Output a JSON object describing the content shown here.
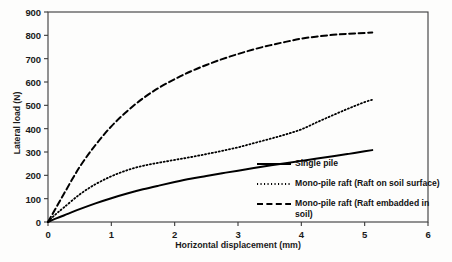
{
  "chart_data": {
    "type": "line",
    "title": "",
    "xlabel": "Horizontal displacement (mm)",
    "ylabel": "Lateral load (N)",
    "xlim": [
      0,
      6
    ],
    "ylim": [
      0,
      900
    ],
    "xticks": [
      0,
      1,
      2,
      3,
      4,
      5,
      6
    ],
    "yticks": [
      0,
      100,
      200,
      300,
      400,
      500,
      600,
      700,
      800,
      900
    ],
    "xtick_labels": [
      "0",
      "1",
      "2",
      "3",
      "4",
      "5",
      "6"
    ],
    "ytick_labels": [
      "0",
      "100",
      "200",
      "300",
      "400",
      "500",
      "600",
      "700",
      "800",
      "900"
    ],
    "grid": false,
    "legend_position": "inside-lower-right",
    "series": [
      {
        "name": "Single pile",
        "style": "solid",
        "color": "#000000",
        "x": [
          0,
          0.1,
          0.25,
          0.5,
          0.75,
          1.0,
          1.25,
          1.5,
          1.75,
          2.0,
          2.25,
          2.5,
          2.75,
          3.0,
          3.25,
          3.5,
          3.75,
          4.0,
          4.25,
          4.5,
          4.75,
          5.0,
          5.12
        ],
        "y": [
          0,
          12,
          28,
          55,
          80,
          102,
          122,
          140,
          156,
          171,
          185,
          197,
          209,
          220,
          231,
          242,
          252,
          262,
          272,
          282,
          292,
          303,
          308
        ]
      },
      {
        "name": "Mono-pile raft (Raft on soil surface)",
        "style": "dotted",
        "color": "#000000",
        "x": [
          0,
          0.1,
          0.25,
          0.5,
          0.75,
          1.0,
          1.25,
          1.5,
          1.75,
          2.0,
          2.25,
          2.5,
          2.75,
          3.0,
          3.25,
          3.5,
          3.75,
          4.0,
          4.25,
          4.5,
          4.75,
          5.0,
          5.12
        ],
        "y": [
          0,
          28,
          62,
          118,
          162,
          196,
          222,
          241,
          254,
          266,
          278,
          291,
          305,
          320,
          338,
          356,
          375,
          397,
          428,
          458,
          487,
          514,
          524
        ]
      },
      {
        "name": "Mono-pile raft (Raft embadded in soil)",
        "style": "dashed",
        "color": "#000000",
        "x": [
          0,
          0.1,
          0.25,
          0.5,
          0.75,
          1.0,
          1.25,
          1.5,
          1.75,
          2.0,
          2.25,
          2.5,
          2.75,
          3.0,
          3.25,
          3.5,
          3.75,
          4.0,
          4.25,
          4.5,
          4.75,
          5.0,
          5.12
        ],
        "y": [
          0,
          48,
          120,
          236,
          330,
          410,
          475,
          530,
          575,
          612,
          645,
          673,
          698,
          720,
          740,
          757,
          772,
          786,
          795,
          802,
          807,
          810,
          812
        ]
      }
    ]
  },
  "legend": {
    "items": [
      {
        "label": "Single pile",
        "style": "solid"
      },
      {
        "label": "Mono-pile raft (Raft on soil surface)",
        "style": "dotted"
      },
      {
        "label": "Mono-pile raft (Raft embadded in soil)",
        "style": "dashed"
      }
    ]
  },
  "axes": {
    "y_title": "Lateral load (N)",
    "x_title": "Horizontal displacement (mm)"
  }
}
